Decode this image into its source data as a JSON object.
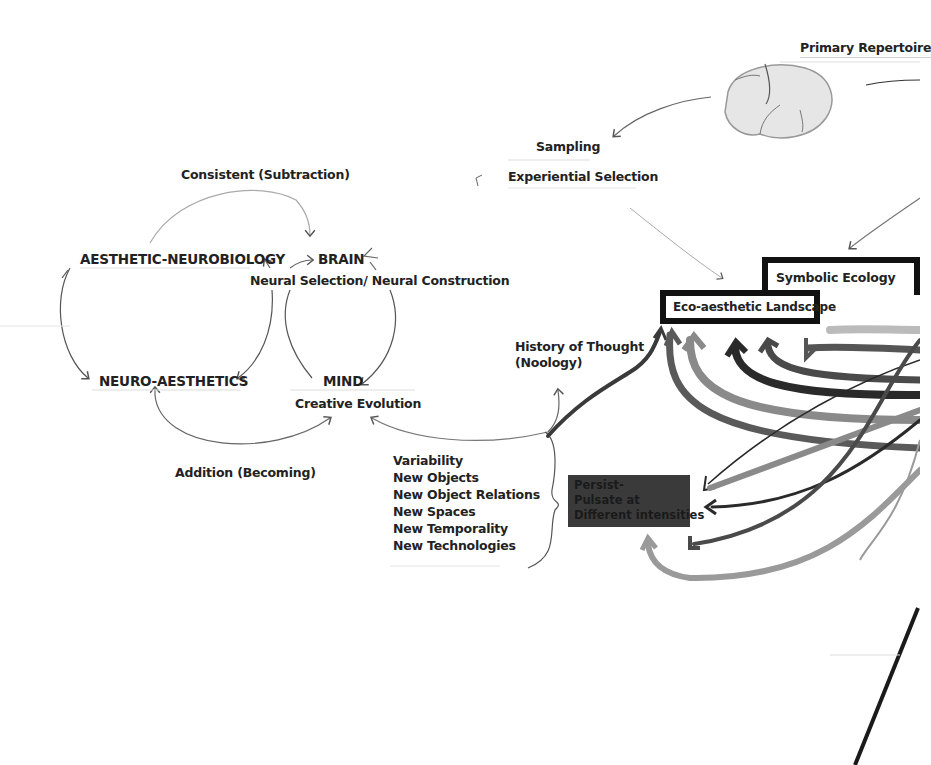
{
  "diagram": {
    "top_right": {
      "primary_repertoire": "Primary Repertoire",
      "brain_sketch": "brain-sketch"
    },
    "selection": {
      "sampling": "Sampling",
      "experiential_selection": "Experiential Selection"
    },
    "left_cycle": {
      "consistent": "Consistent (Subtraction)",
      "aesthetic_neurobiology": "AESTHETIC-NEUROBIOLOGY",
      "brain": "BRAIN",
      "neural_selection": "Neural Selection/ Neural Construction",
      "neuro_aesthetics": "NEURO-AESTHETICS",
      "mind": "MIND",
      "creative_evolution": "Creative Evolution",
      "addition": "Addition (Becoming)"
    },
    "history": {
      "line1": "History of Thought",
      "line2": "(Noology)"
    },
    "variability_list": [
      "Variability",
      "New Objects",
      "New Object Relations",
      "New Spaces",
      "New Temporality",
      "New Technologies"
    ],
    "boxes": {
      "symbolic_ecology": "Symbolic Ecology",
      "eco_aesthetic_landscape": "Eco-aesthetic Landscape"
    },
    "persist_box": [
      "Persist-",
      "Pulsate at",
      "Different intensities"
    ],
    "colors": {
      "ink": "#111111",
      "marker_dark": "#2a2a2a",
      "marker_mid": "#5a5a5a",
      "marker_light": "#8a8a8a",
      "marker_pale": "#b5b5b5",
      "pencil": "#777777"
    }
  }
}
